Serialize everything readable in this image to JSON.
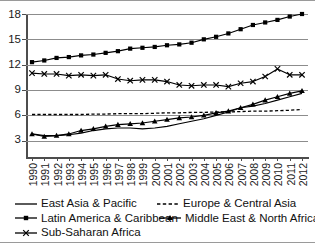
{
  "chart_data": {
    "type": "line",
    "title": "",
    "xlabel": "",
    "ylabel": "",
    "ylim": [
      0,
      18
    ],
    "yticks": [
      3,
      6,
      9,
      12,
      15,
      18
    ],
    "grid": true,
    "legend_position": "bottom",
    "categories": [
      "1990",
      "1991",
      "1992",
      "1993",
      "1994",
      "1995",
      "1996",
      "1997",
      "1998",
      "1999",
      "2000",
      "2001",
      "2002",
      "2003",
      "2004",
      "2005",
      "2006",
      "2007",
      "2008",
      "2009",
      "2010",
      "2011",
      "2012"
    ],
    "series": [
      {
        "name": "East Asia & Pacific",
        "marker": "none",
        "dash": "solid",
        "color": "#000000",
        "values": [
          3.8,
          3.6,
          3.6,
          3.7,
          3.9,
          4.2,
          4.4,
          4.5,
          4.5,
          4.4,
          4.5,
          4.7,
          5.0,
          5.3,
          5.6,
          6.0,
          6.4,
          6.9,
          7.1,
          7.4,
          7.8,
          8.2,
          8.6
        ]
      },
      {
        "name": "Europe & Central Asia",
        "marker": "none",
        "dash": "dashed",
        "color": "#000000",
        "values": [
          6.1,
          6.1,
          6.1,
          6.1,
          6.1,
          6.15,
          6.15,
          6.2,
          6.2,
          6.2,
          6.25,
          6.3,
          6.3,
          6.35,
          6.35,
          6.4,
          6.4,
          6.45,
          6.5,
          6.5,
          6.55,
          6.6,
          6.7
        ]
      },
      {
        "name": "Latin America & Caribbean",
        "marker": "square",
        "dash": "solid",
        "color": "#000000",
        "values": [
          12.3,
          12.5,
          12.8,
          12.9,
          13.1,
          13.2,
          13.4,
          13.6,
          13.9,
          14.0,
          14.1,
          14.3,
          14.4,
          14.6,
          15.0,
          15.3,
          15.7,
          16.2,
          16.7,
          17.0,
          17.3,
          17.7,
          18.0
        ]
      },
      {
        "name": "Middle East & North Africa",
        "marker": "triangle",
        "dash": "solid",
        "color": "#000000",
        "values": [
          3.8,
          3.5,
          3.6,
          3.8,
          4.2,
          4.4,
          4.7,
          4.9,
          5.0,
          5.1,
          5.3,
          5.5,
          5.7,
          5.8,
          6.0,
          6.3,
          6.5,
          6.9,
          7.3,
          7.8,
          8.2,
          8.6,
          8.9
        ]
      },
      {
        "name": "Sub-Saharan Africa",
        "marker": "x",
        "dash": "solid",
        "color": "#000000",
        "values": [
          11.0,
          10.9,
          10.9,
          10.7,
          10.8,
          10.7,
          10.8,
          10.3,
          10.1,
          10.2,
          10.2,
          10.0,
          9.6,
          9.5,
          9.6,
          9.6,
          9.4,
          9.8,
          10.0,
          10.6,
          11.5,
          10.8,
          10.8
        ]
      }
    ]
  },
  "axis": {
    "ytick_labels": [
      "18",
      "15",
      "12",
      "9",
      "6",
      "3"
    ],
    "xtick_labels": [
      "1990",
      "1991",
      "1992",
      "1993",
      "1994",
      "1995",
      "1996",
      "1997",
      "1998",
      "1999",
      "2000",
      "2001",
      "2002",
      "2003",
      "2004",
      "2005",
      "2006",
      "2007",
      "2008",
      "2009",
      "2010",
      "2011",
      "2012"
    ]
  },
  "legend": {
    "rows": [
      [
        {
          "label": "East Asia & Pacific",
          "marker": "line-solid"
        },
        {
          "label": "Europe & Central Asia",
          "marker": "line-dashed"
        }
      ],
      [
        {
          "label": "Latin America & Caribbean",
          "marker": "line-square"
        },
        {
          "label": "Middle East & North Africa",
          "marker": "line-triangle"
        }
      ],
      [
        {
          "label": "Sub-Saharan Africa",
          "marker": "line-x"
        }
      ]
    ]
  }
}
